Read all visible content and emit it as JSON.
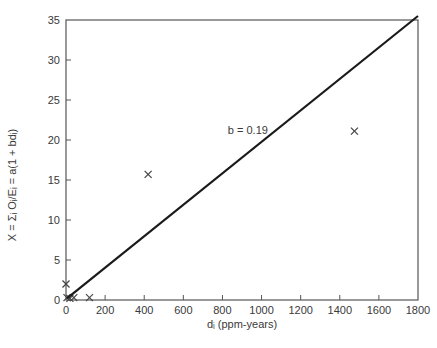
{
  "chart_data": {
    "type": "scatter",
    "title": "",
    "xlabel": "dᵢ (ppm-years)",
    "ylabel": "X = Σᵢ Oᵢ/Eᵢ = a(1 + bdᵢ)",
    "xlim": [
      0,
      1800
    ],
    "ylim": [
      0,
      35
    ],
    "xticks": [
      0,
      200,
      400,
      600,
      800,
      1000,
      1200,
      1400,
      1600,
      1800
    ],
    "yticks": [
      0,
      5,
      10,
      15,
      20,
      25,
      30,
      35
    ],
    "xtick_labels": [
      "0",
      "200",
      "400",
      "600",
      "800",
      "1000",
      "1200",
      "1400",
      "1600",
      "1800"
    ],
    "ytick_labels": [
      "0",
      "5",
      "10",
      "15",
      "20",
      "25",
      "30",
      "35"
    ],
    "grid": false,
    "legend": "none",
    "series": [
      {
        "name": "observed",
        "marker": "x",
        "points": [
          {
            "x": 0,
            "y": 2.0
          },
          {
            "x": 5,
            "y": 0.3
          },
          {
            "x": 20,
            "y": 0.2
          },
          {
            "x": 40,
            "y": 0.3
          },
          {
            "x": 120,
            "y": 0.3
          },
          {
            "x": 420,
            "y": 15.7
          },
          {
            "x": 1475,
            "y": 21.1
          }
        ]
      },
      {
        "name": "fitted line",
        "type": "line",
        "points": [
          {
            "x": 5,
            "y": 0.2
          },
          {
            "x": 1800,
            "y": 35.5
          }
        ]
      }
    ],
    "annotations": [
      {
        "text": "b = 0.19",
        "x": 930,
        "y": 20.8
      }
    ]
  }
}
